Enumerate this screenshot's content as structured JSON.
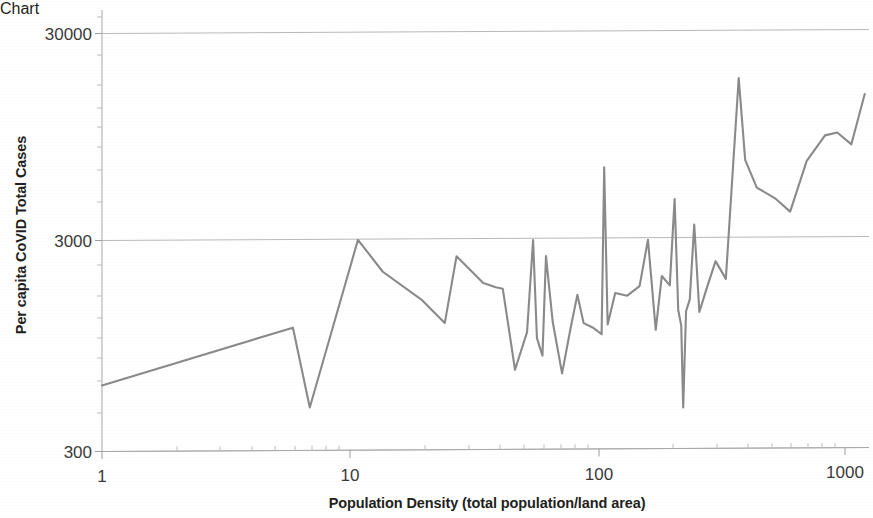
{
  "chart_data": {
    "type": "line",
    "title": "",
    "subtitle": "",
    "xlabel": "Population Density (total population/land area)",
    "ylabel": "Per capita CoVID Total Cases",
    "xscale": "log",
    "yscale": "log",
    "xlim": [
      1,
      1300
    ],
    "ylim": [
      300,
      42000
    ],
    "x_ticklabels": [
      "1",
      "10",
      "100",
      "1000"
    ],
    "x_tickvalues": [
      1,
      10,
      100,
      1000
    ],
    "y_ticklabels": [
      "300",
      "3000",
      "30000"
    ],
    "y_tickvalues": [
      300,
      3000,
      30000
    ],
    "grid": "horizontal-major-only",
    "legend": "none",
    "series": [
      {
        "name": "Per capita CoVID Total Cases",
        "color": "#8a8a8a",
        "x": [
          1.0,
          5.9,
          6.9,
          10.8,
          13.6,
          19.6,
          24.2,
          27.0,
          34.6,
          38.9,
          41.5,
          46.5,
          52.0,
          55.0,
          57.0,
          60.0,
          62.0,
          66.0,
          72.0,
          78.0,
          83.0,
          88.0,
          96.0,
          104.0,
          106.5,
          110.0,
          118.0,
          132.0,
          148.0,
          160.0,
          172.0,
          182.0,
          196.0,
          205.0,
          212.0,
          218.0,
          222.0,
          228.0,
          236.0,
          246.0,
          258.0,
          275.0,
          300.0,
          330.0,
          372.0,
          395.0,
          440.0,
          520.0,
          600.0,
          700.0,
          830.0,
          930.0,
          1060.0,
          1200.0
        ],
        "y": [
          620,
          1160,
          480,
          3050,
          2140,
          1560,
          1210,
          2530,
          1880,
          1790,
          1760,
          720,
          1090,
          3010,
          1020,
          840,
          2520,
          1220,
          690,
          1140,
          1640,
          1200,
          1140,
          1060,
          6700,
          1180,
          1670,
          1620,
          1800,
          3000,
          1110,
          2010,
          1810,
          4700,
          1380,
          1160,
          470,
          1360,
          1550,
          3540,
          1350,
          1720,
          2360,
          1940,
          17800,
          7200,
          5300,
          4720,
          4060,
          7100,
          9400,
          9700,
          8500,
          14800
        ]
      }
    ]
  },
  "axes": {
    "x_title": "Population Density (total population/land area)",
    "y_title": "Per capita CoVID Total Cases",
    "x_ticks": [
      "1",
      "10",
      "100",
      "1000"
    ],
    "y_ticks": [
      "300",
      "3000",
      "30000"
    ]
  },
  "style": {
    "line_color": "#8a8a8a",
    "grid_color": "#b9b9b9",
    "axis_color": "#a9a9a9",
    "text_color": "#231f20",
    "background": "#ffffff"
  }
}
